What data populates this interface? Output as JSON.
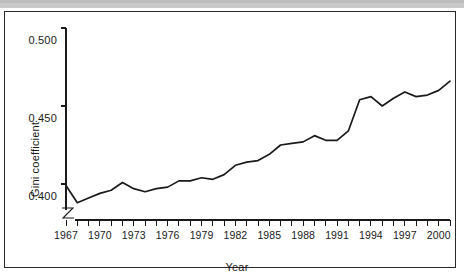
{
  "figure": {
    "decorations": {
      "top_strip_color": "#c9c9c9",
      "frame_color": "#2a2a2a",
      "background_color": "#ffffff",
      "line_color": "#1a1a1a"
    }
  },
  "chart_data": {
    "type": "line",
    "title": "",
    "xlabel": "Year",
    "ylabel": "Gini coefficient",
    "xlim": [
      1967,
      2001
    ],
    "ylim": [
      0.385,
      0.5
    ],
    "y_axis_break": true,
    "grid": false,
    "legend": "none",
    "y_ticks": [
      0.4,
      0.45,
      0.5
    ],
    "y_tick_labels": [
      "0.400",
      "0.450",
      "0.500"
    ],
    "x_tick_labels": [
      "1967",
      "1970",
      "1973",
      "1976",
      "1979",
      "1982",
      "1985",
      "1988",
      "1991",
      "1994",
      "1997",
      "2000"
    ],
    "x_tick_label_years": [
      1967,
      1970,
      1973,
      1976,
      1979,
      1982,
      1985,
      1988,
      1991,
      1994,
      1997,
      2000
    ],
    "x_minor_tick_years": [
      1967,
      1968,
      1969,
      1970,
      1971,
      1972,
      1973,
      1974,
      1975,
      1976,
      1977,
      1978,
      1979,
      1980,
      1981,
      1982,
      1983,
      1984,
      1985,
      1986,
      1987,
      1988,
      1989,
      1990,
      1991,
      1992,
      1993,
      1994,
      1995,
      1996,
      1997,
      1998,
      1999,
      2000,
      2001
    ],
    "x": [
      1967,
      1968,
      1969,
      1970,
      1971,
      1972,
      1973,
      1974,
      1975,
      1976,
      1977,
      1978,
      1979,
      1980,
      1981,
      1982,
      1983,
      1984,
      1985,
      1986,
      1987,
      1988,
      1989,
      1990,
      1991,
      1992,
      1993,
      1994,
      1995,
      1996,
      1997,
      1998,
      1999,
      2000,
      2001
    ],
    "values": [
      0.399,
      0.388,
      0.391,
      0.394,
      0.396,
      0.401,
      0.397,
      0.395,
      0.397,
      0.398,
      0.402,
      0.402,
      0.404,
      0.403,
      0.406,
      0.412,
      0.414,
      0.415,
      0.419,
      0.425,
      0.426,
      0.427,
      0.431,
      0.428,
      0.428,
      0.434,
      0.454,
      0.456,
      0.45,
      0.455,
      0.459,
      0.456,
      0.457,
      0.46,
      0.466
    ],
    "series": [
      {
        "name": "Gini coefficient",
        "values": [
          0.399,
          0.388,
          0.391,
          0.394,
          0.396,
          0.401,
          0.397,
          0.395,
          0.397,
          0.398,
          0.402,
          0.402,
          0.404,
          0.403,
          0.406,
          0.412,
          0.414,
          0.415,
          0.419,
          0.425,
          0.426,
          0.427,
          0.431,
          0.428,
          0.428,
          0.434,
          0.454,
          0.456,
          0.45,
          0.455,
          0.459,
          0.456,
          0.457,
          0.46,
          0.466
        ]
      }
    ]
  }
}
